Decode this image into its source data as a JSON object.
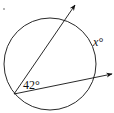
{
  "diagram": {
    "type": "geometry",
    "circle": {
      "cx": 50,
      "cy": 64,
      "r": 46
    },
    "vertex": {
      "x": 14,
      "y": 94
    },
    "rays": [
      {
        "name": "upper-ray",
        "to": {
          "x": 75,
          "y": 5
        }
      },
      {
        "name": "lower-ray",
        "to": {
          "x": 112,
          "y": 74
        }
      }
    ],
    "labels": {
      "angle": "42°",
      "arc": "x°"
    },
    "colors": {
      "stroke": "#111111",
      "background": "#ffffff"
    }
  }
}
